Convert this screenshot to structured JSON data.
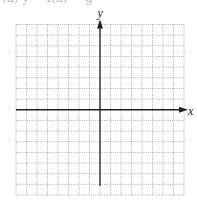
{
  "header": {
    "cut_off_text": "(a) y = f(x) = g"
  },
  "graph": {
    "x_axis_label": "x",
    "y_axis_label": "y",
    "grid": {
      "columns": 16,
      "rows": 16,
      "left": 16,
      "top": 24.5,
      "right": 184,
      "bottom": 195,
      "line_style": "dotted",
      "line_color": "#9a9a9a"
    },
    "axis_color": "#222222"
  }
}
